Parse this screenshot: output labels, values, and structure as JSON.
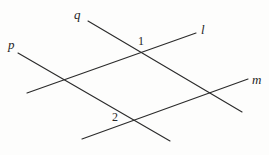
{
  "figure": {
    "background_color": "#fdfdfc",
    "stroke_color": "#2b2b2b",
    "width": 269,
    "height": 155,
    "lines": [
      {
        "id": "l",
        "label": "l",
        "label_style": "italic",
        "x1": 27,
        "y1": 93,
        "x2": 196,
        "y2": 33
      },
      {
        "id": "m",
        "label": "m",
        "label_style": "italic",
        "x1": 82,
        "y1": 139,
        "x2": 248,
        "y2": 79
      },
      {
        "id": "p",
        "label": "p",
        "label_style": "italic",
        "x1": 18,
        "y1": 53,
        "x2": 170,
        "y2": 141
      },
      {
        "id": "q",
        "label": "q",
        "label_style": "italic",
        "x1": 88,
        "y1": 21,
        "x2": 242,
        "y2": 112
      }
    ],
    "angle_labels": [
      {
        "id": "angle-1",
        "text": "1",
        "x": 138,
        "y": 35
      },
      {
        "id": "angle-2",
        "text": "2",
        "x": 112,
        "y": 111
      }
    ],
    "intersections": [
      {
        "id": "l-q",
        "x": 139,
        "y": 50,
        "marked": "1"
      },
      {
        "id": "l-p",
        "x": 64,
        "y": 79,
        "marked": ""
      },
      {
        "id": "m-q",
        "x": 214,
        "y": 96,
        "marked": ""
      },
      {
        "id": "m-p",
        "x": 137,
        "y": 124,
        "marked": "2"
      }
    ]
  }
}
